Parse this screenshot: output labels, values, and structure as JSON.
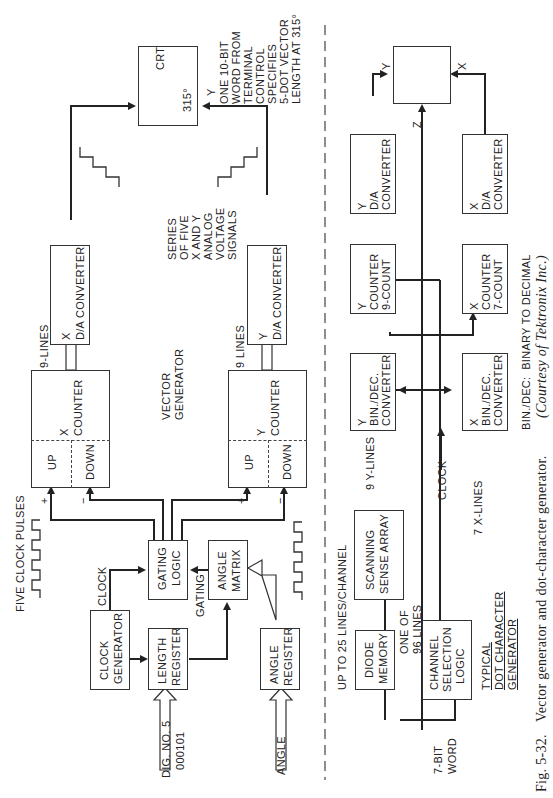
{
  "figure": {
    "number": "Fig. 5-32.",
    "caption": "Vector generator and dot-character generator.",
    "credit": "(Courtesy of Tektronix Inc.)",
    "abbreviation_note": "BIN./DEC:  BINARY TO DECIMAL"
  },
  "vector_generator": {
    "title_line1": "VECTOR",
    "title_line2": "GENERATOR",
    "crt": {
      "label": "CRT",
      "angle": "315°",
      "y_label": "Y"
    },
    "note": [
      "ONE 10-BIT",
      "WORD FROM",
      "TERMINAL",
      "CONTROL",
      "SPECIFIES",
      "5-DOT VECTOR",
      "LENGTH AT 315°"
    ],
    "signals_note": [
      "SERIES",
      "OF FIVE",
      "X AND Y",
      "ANALOG",
      "VOLTAGE",
      "SIGNALS"
    ],
    "x_da": {
      "axis": "X",
      "label": "D/A CONVERTER"
    },
    "y_da": {
      "axis": "Y",
      "label": "D/A CONVERTER"
    },
    "x_lines": "9-LINES",
    "y_lines": "9 LINES",
    "x_counter": {
      "axis": "X",
      "label": "COUNTER",
      "up": "UP",
      "down": "DOWN"
    },
    "y_counter": {
      "axis": "Y",
      "label": "COUNTER",
      "up": "UP",
      "down": "DOWN"
    },
    "plus": "+",
    "minus": "−",
    "clock_pulses": "FIVE CLOCK PULSES",
    "gating_logic": [
      "GATING",
      "LOGIC"
    ],
    "angle_matrix": [
      "ANGLE",
      "MATRIX"
    ],
    "clock_generator": [
      "CLOCK",
      "GENERATOR"
    ],
    "length_register": [
      "LENGTH",
      "REGISTER"
    ],
    "angle_register": [
      "ANGLE",
      "REGISTER"
    ],
    "clock_label": "CLOCK",
    "gating_label": "GATING",
    "dig_input": [
      "DIG. NO. 5",
      "000101"
    ],
    "angle_input": "ANGLE"
  },
  "dot_generator": {
    "title": [
      "TYPICAL",
      "DOT CHARACTER",
      "GENERATOR"
    ],
    "crt_labels": {
      "y": "Y",
      "x": "X",
      "z": "Z"
    },
    "y_da": {
      "axis": "Y",
      "label": [
        "D/A",
        "CONVERTER"
      ]
    },
    "x_da": {
      "axis": "X",
      "label": [
        "D/A",
        "CONVERTER"
      ]
    },
    "y_counter": {
      "axis": "Y",
      "label": [
        "COUNTER",
        "9-COUNT"
      ]
    },
    "x_counter": {
      "axis": "X",
      "label": [
        "COUNTER",
        "7-COUNT"
      ]
    },
    "y_bindec": {
      "axis": "Y",
      "label": [
        "BIN./DEC.",
        "CONVERTER"
      ]
    },
    "x_bindec": {
      "axis": "X",
      "label": [
        "BIN./DEC.",
        "CONVERTER"
      ]
    },
    "y_lines": "9 Y-LINES",
    "x_lines": "7 X-LINES",
    "clock": "CLOCK",
    "scanning": [
      "SCANNING",
      "SENSE ARRAY"
    ],
    "diode_memory": [
      "DIODE",
      "MEMORY"
    ],
    "channel_logic": [
      "CHANNEL",
      "SELECTION",
      "LOGIC"
    ],
    "lines_per_channel": "UP TO 25 LINES/CHANNEL",
    "one_of": [
      "ONE OF",
      "96 LINES"
    ],
    "word_input": [
      "7-BIT",
      "WORD"
    ]
  }
}
